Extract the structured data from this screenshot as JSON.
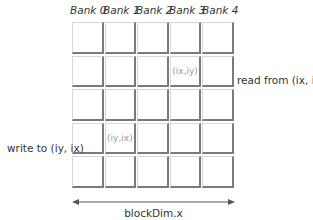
{
  "banks": [
    "Bank 0",
    "Bank 1",
    "Bank 2",
    "Bank 3",
    "Bank 4"
  ],
  "grid": {
    "rows": 5,
    "cols": 5,
    "cells": [
      [
        "",
        "",
        "",
        "",
        ""
      ],
      [
        "",
        "",
        "",
        "(ix,iy)",
        ""
      ],
      [
        "",
        "",
        "",
        "",
        ""
      ],
      [
        "",
        "(iy,ix)",
        "",
        "",
        ""
      ],
      [
        "",
        "",
        "",
        "",
        ""
      ]
    ]
  },
  "labels": {
    "read": "read from (ix, iy)",
    "write": "write to (iy, ix)",
    "dimension": "blockDim.x"
  },
  "colors": {
    "cell_border_dark": "#7a7a7a",
    "cell_border_light": "#d8d8d8",
    "cell_text": "#999999",
    "text": "#333333"
  }
}
